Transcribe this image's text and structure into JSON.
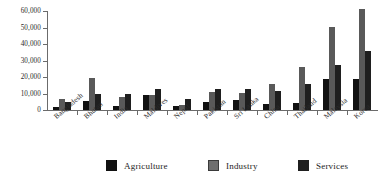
{
  "chart_data": {
    "type": "bar",
    "title": "",
    "subtitle": "",
    "xlabel": "",
    "ylabel": "",
    "ylim": [
      0,
      60000
    ],
    "ytick_values": [
      0,
      10000,
      20000,
      30000,
      40000,
      50000,
      60000
    ],
    "ytick_labels": [
      "0",
      "10,000",
      "20,000",
      "30,000",
      "40,000",
      "50,000",
      "60,000"
    ],
    "grid": false,
    "legend_position": "bottom",
    "categories": [
      "Bangladesh",
      "Bhutan",
      "India",
      "Maldives",
      "Nepal",
      "Pakistan",
      "Sri Lanka",
      "China",
      "Thailand",
      "Malaysia",
      "Korea"
    ],
    "series": [
      {
        "name": "Agriculture",
        "color": "#111111",
        "values": [
          1800,
          5500,
          2200,
          9300,
          2200,
          5000,
          6000,
          3500,
          4500,
          19000,
          18500
        ]
      },
      {
        "name": "Industry",
        "color": "#595959",
        "values": [
          6500,
          19500,
          7800,
          8800,
          2900,
          11000,
          10100,
          16000,
          26000,
          50500,
          61000
        ]
      },
      {
        "name": "Services",
        "color": "#1f1f1f",
        "values": [
          5000,
          9800,
          9900,
          13000,
          6400,
          12500,
          12600,
          11400,
          15500,
          27000,
          36000
        ]
      }
    ]
  },
  "legend": {
    "items": [
      {
        "label": "Agriculture",
        "swatch": "agriculture"
      },
      {
        "label": "Industry",
        "swatch": "industry"
      },
      {
        "label": "Services",
        "swatch": "services"
      }
    ]
  }
}
